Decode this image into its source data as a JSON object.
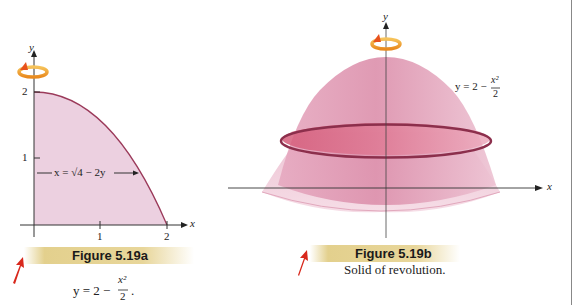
{
  "figure_a": {
    "title": "Figure 5.19a",
    "caption_lhs": "y = 2 − ",
    "caption_num": "x²",
    "caption_den": "2",
    "caption_end": ".",
    "axis_x_label": "x",
    "axis_y_label": "y",
    "x_ticks": [
      "1",
      "2"
    ],
    "y_ticks": [
      "1",
      "2"
    ],
    "curve_label": "x = √4 − 2y",
    "region_color": "#e9c8dc",
    "curve_color": "#9b3a5a"
  },
  "figure_b": {
    "title": "Figure 5.19b",
    "caption": "Solid of revolution.",
    "axis_x_label": "x",
    "axis_y_label": "y",
    "equation_lhs": "y = 2 − ",
    "equation_num": "x²",
    "equation_den": "2",
    "solid_color": "#d98aa8",
    "disk_color": "#c9506f"
  },
  "icons": {
    "rotation": "rotation-arrow-icon",
    "pointer": "red-pointer-arrow-icon"
  },
  "colors": {
    "caption_bar": "#e3d08d",
    "pointer": "#d8281c",
    "rotation": "#f0a030"
  }
}
